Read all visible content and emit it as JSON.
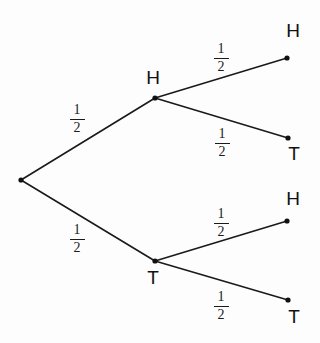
{
  "diagram": {
    "background_color": "#fdfdfd",
    "line_color": "#1a1a1a",
    "node_color": "#111111",
    "nodes": [
      {
        "id": "root",
        "label": "",
        "x": 21,
        "y": 180
      },
      {
        "id": "h1",
        "label": "H",
        "x": 155,
        "y": 98,
        "label_x": 153,
        "label_y": 68
      },
      {
        "id": "t1",
        "label": "T",
        "x": 155,
        "y": 261,
        "label_x": 153,
        "label_y": 268
      },
      {
        "id": "hh",
        "label": "H",
        "x": 287,
        "y": 58,
        "label_x": 293,
        "label_y": 21
      },
      {
        "id": "ht",
        "label": "T",
        "x": 288,
        "y": 138,
        "label_x": 294,
        "label_y": 144
      },
      {
        "id": "th",
        "label": "H",
        "x": 287,
        "y": 221,
        "label_x": 293,
        "label_y": 189
      },
      {
        "id": "tt",
        "label": "T",
        "x": 288,
        "y": 300,
        "label_x": 294,
        "label_y": 307
      }
    ],
    "edges": [
      {
        "id": "edge-root-h",
        "from": "root",
        "to": "h1",
        "x1": 21,
        "y1": 180,
        "x2": 155,
        "y2": 98,
        "prob_numerator": "1",
        "prob_denominator": "2",
        "prob_x": 77,
        "prob_y": 103
      },
      {
        "id": "edge-root-t",
        "from": "root",
        "to": "t1",
        "x1": 21,
        "y1": 180,
        "x2": 155,
        "y2": 261,
        "prob_numerator": "1",
        "prob_denominator": "2",
        "prob_x": 77,
        "prob_y": 223
      },
      {
        "id": "edge-h-hh",
        "from": "h1",
        "to": "hh",
        "x1": 155,
        "y1": 98,
        "x2": 287,
        "y2": 58,
        "prob_numerator": "1",
        "prob_denominator": "2",
        "prob_x": 221,
        "prob_y": 42
      },
      {
        "id": "edge-h-ht",
        "from": "h1",
        "to": "ht",
        "x1": 155,
        "y1": 98,
        "x2": 288,
        "y2": 138,
        "prob_numerator": "1",
        "prob_denominator": "2",
        "prob_x": 222,
        "prob_y": 127
      },
      {
        "id": "edge-t-th",
        "from": "t1",
        "to": "th",
        "x1": 155,
        "y1": 261,
        "x2": 287,
        "y2": 221,
        "prob_numerator": "1",
        "prob_denominator": "2",
        "prob_x": 221,
        "prob_y": 207
      },
      {
        "id": "edge-t-tt",
        "from": "t1",
        "to": "tt",
        "x1": 155,
        "y1": 261,
        "x2": 288,
        "y2": 300,
        "prob_numerator": "1",
        "prob_denominator": "2",
        "prob_x": 221,
        "prob_y": 290
      }
    ]
  },
  "chart_data": {
    "type": "diagram",
    "stages": 2,
    "root": "start",
    "branches": [
      {
        "stage": 1,
        "outcome": "H",
        "probability": 0.5,
        "probability_label": "1/2"
      },
      {
        "stage": 1,
        "outcome": "T",
        "probability": 0.5,
        "probability_label": "1/2"
      },
      {
        "stage": 2,
        "parent": "H",
        "outcome": "H",
        "probability": 0.5,
        "probability_label": "1/2"
      },
      {
        "stage": 2,
        "parent": "H",
        "outcome": "T",
        "probability": 0.5,
        "probability_label": "1/2"
      },
      {
        "stage": 2,
        "parent": "T",
        "outcome": "H",
        "probability": 0.5,
        "probability_label": "1/2"
      },
      {
        "stage": 2,
        "parent": "T",
        "outcome": "T",
        "probability": 0.5,
        "probability_label": "1/2"
      }
    ],
    "leaf_outcomes": [
      "HH",
      "HT",
      "TH",
      "TT"
    ],
    "leaf_probabilities": [
      0.25,
      0.25,
      0.25,
      0.25
    ]
  }
}
